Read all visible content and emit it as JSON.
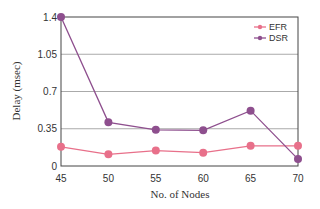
{
  "chart_data": {
    "type": "line",
    "title": "",
    "xlabel": "No. of Nodes",
    "ylabel": "Delay (msec)",
    "x": [
      45,
      50,
      55,
      60,
      65,
      70
    ],
    "x_tick_labels": [
      "45",
      "50",
      "55",
      "60",
      "65",
      "70"
    ],
    "y_tick_values": [
      0,
      0.35,
      0.7,
      1.05,
      1.4
    ],
    "y_tick_labels": [
      "0",
      "0.35",
      "0.7",
      "1.05",
      "1.4"
    ],
    "xlim": [
      45,
      70
    ],
    "ylim": [
      0,
      1.4
    ],
    "grid": "horizontal",
    "legend_position": "upper right",
    "series": [
      {
        "name": "EFR",
        "color": "#e8708a",
        "values": [
          0.18,
          0.11,
          0.145,
          0.125,
          0.19,
          0.19
        ]
      },
      {
        "name": "DSR",
        "color": "#8e4f8e",
        "values": [
          1.4,
          0.41,
          0.34,
          0.335,
          0.52,
          0.065
        ]
      }
    ]
  }
}
